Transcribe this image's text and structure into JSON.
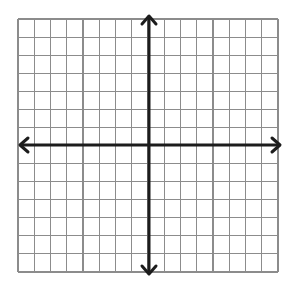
{
  "diagram": {
    "type": "coordinate-plane",
    "grid": {
      "columns": 16,
      "rows": 14,
      "left": 18,
      "top": 19,
      "right": 278,
      "bottom": 272,
      "line_color": "#8c8c8c"
    },
    "axes": {
      "origin_x": 149,
      "origin_y": 145,
      "color": "#1c1c1c",
      "x_axis": {
        "start": 20,
        "end": 280,
        "arrows": [
          "left",
          "right"
        ]
      },
      "y_axis": {
        "start": 16,
        "end": 274,
        "arrows": [
          "up",
          "down"
        ]
      },
      "columns_left_of_y_axis": 8,
      "columns_right_of_y_axis": 8,
      "rows_above_x_axis": 7,
      "rows_below_x_axis": 7
    },
    "labels": []
  }
}
